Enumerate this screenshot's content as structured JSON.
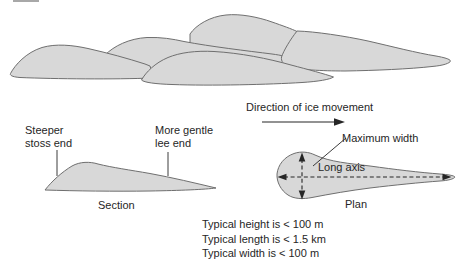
{
  "colors": {
    "fill": "#d8d8d8",
    "outline": "#6f6f6f",
    "ink": "#262626"
  },
  "section": {
    "stoss_label": "Steeper\nstoss end",
    "lee_label": "More gentle\nlee end",
    "caption": "Section"
  },
  "plan": {
    "direction_label": "Direction of ice movement",
    "max_width_label": "Maximum width",
    "long_axis_label": "Long axis",
    "caption": "Plan"
  },
  "stats": [
    "Typical height is < 100 m",
    "Typical length is < 1.5 km",
    "Typical width is < 100 m"
  ]
}
